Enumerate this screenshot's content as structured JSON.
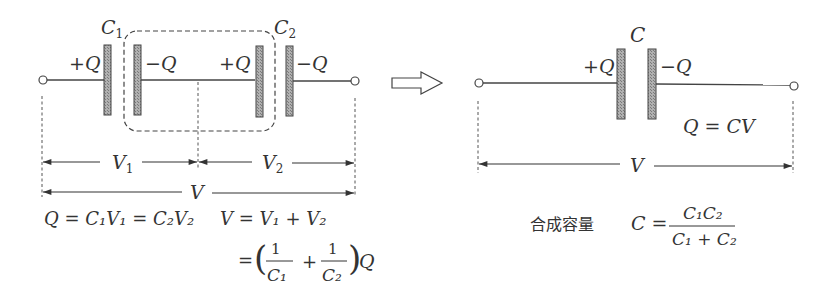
{
  "left_circuit": {
    "capacitor1_label": "C",
    "capacitor1_sub": "1",
    "capacitor2_label": "C",
    "capacitor2_sub": "2",
    "charges": [
      "+Q",
      "−Q",
      "+Q",
      "−Q"
    ],
    "v1_label": "V",
    "v1_sub": "1",
    "v2_label": "V",
    "v2_sub": "2",
    "v_total_label": "V",
    "eq1": "Q = C₁V₁ = C₂V₂",
    "eq2": "V = V₁ + V₂",
    "eq3_prefix": "=",
    "eq3_num1": "1",
    "eq3_den1": "C₁",
    "eq3_plus": "+",
    "eq3_num2": "1",
    "eq3_den2": "C₂",
    "eq3_suffix": "Q"
  },
  "arrow": {
    "icon": "hollow-right-arrow"
  },
  "right_circuit": {
    "capacitor_label": "C",
    "charges": [
      "+Q",
      "−Q"
    ],
    "relation": "Q = CV",
    "v_label": "V",
    "combined_label": "合成容量",
    "formula_lhs": "C =",
    "formula_num": "C₁C₂",
    "formula_den": "C₁ + C₂"
  },
  "colors": {
    "line": "#444444",
    "plate_fill": "#9a9a9a",
    "text": "#333333"
  }
}
